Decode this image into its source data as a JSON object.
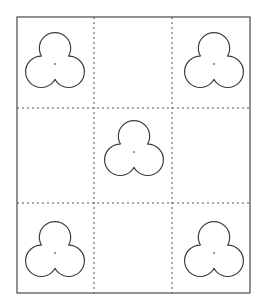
{
  "figure": {
    "background_color": "#ffffff",
    "width": 264,
    "height": 307
  },
  "frame": {
    "name": "outer-rectangle",
    "x": 17,
    "y": 17,
    "width": 233,
    "height": 276,
    "stroke_color": "#4a4a4a",
    "stroke_width": 1.2,
    "fill": "none",
    "style": "solid"
  },
  "grid": {
    "rows": 3,
    "columns": 3,
    "line_style": "dashed",
    "stroke_color": "#555555",
    "stroke_width": 1,
    "dash_pattern": "2,3",
    "vertical_lines_x": [
      94,
      172
    ],
    "horizontal_lines_y": [
      108,
      203
    ],
    "cells": [
      {
        "row": 0,
        "column": 0,
        "name": "cell-top-left",
        "occupied": true
      },
      {
        "row": 0,
        "column": 1,
        "name": "cell-top-center",
        "occupied": false
      },
      {
        "row": 0,
        "column": 2,
        "name": "cell-top-right",
        "occupied": true
      },
      {
        "row": 1,
        "column": 0,
        "name": "cell-middle-left",
        "occupied": false
      },
      {
        "row": 1,
        "column": 1,
        "name": "cell-middle-center",
        "occupied": true
      },
      {
        "row": 1,
        "column": 2,
        "name": "cell-middle-right",
        "occupied": false
      },
      {
        "row": 2,
        "column": 0,
        "name": "cell-bottom-left",
        "occupied": true
      },
      {
        "row": 2,
        "column": 1,
        "name": "cell-bottom-center",
        "occupied": false
      },
      {
        "row": 2,
        "column": 2,
        "name": "cell-bottom-right",
        "occupied": true
      }
    ]
  },
  "shape_style": {
    "name": "trefoil",
    "stroke_color": "#3d3d3d",
    "stroke_width": 1.2,
    "fill_color": "#ffffff",
    "lobe_radius": 16,
    "top_lobe_offset_y": -14,
    "bottom_lobe_offset_x": 14,
    "bottom_lobe_offset_y": 10
  },
  "shapes": [
    {
      "name": "trefoil-top-left",
      "cell": "cell-top-left",
      "cx": 55,
      "cy": 62,
      "scale": 0.98
    },
    {
      "name": "trefoil-top-right",
      "cell": "cell-top-right",
      "cx": 214,
      "cy": 62,
      "scale": 0.98
    },
    {
      "name": "trefoil-center",
      "cell": "cell-middle-center",
      "cx": 134,
      "cy": 150,
      "scale": 0.98
    },
    {
      "name": "trefoil-bottom-left",
      "cell": "cell-bottom-left",
      "cx": 55,
      "cy": 251,
      "scale": 0.98
    },
    {
      "name": "trefoil-bottom-right",
      "cell": "cell-bottom-right",
      "cx": 214,
      "cy": 251,
      "scale": 0.98
    }
  ],
  "counts": {
    "total_cells": 9,
    "occupied_cells": 5,
    "empty_cells": 4,
    "shapes_drawn": 5
  }
}
